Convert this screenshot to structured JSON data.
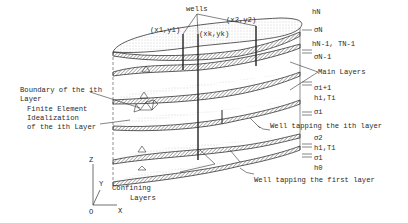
{
  "figure": {
    "labels": {
      "wells": "wells",
      "x1y1": "(x1,y1)",
      "xkyk": "(xk,yk)",
      "x2y2": "(x2,y2)",
      "hN": "hN",
      "sigmaN": "σN",
      "hN1TN1": "hN-1, TN-1",
      "sigmaN1": "σN-1",
      "main_layers": "Main Layers",
      "sigma_i1": "σi+1",
      "hiTi_upper": "hi,Ti",
      "sigma_i": "σi",
      "well_ith": "Well tapping the ith layer",
      "sigma2": "σ2",
      "h1T1": "h1,T1",
      "sigma1": "σ1",
      "h0": "h0",
      "well_first": "Well tapping the first layer",
      "boundary_line1": "Boundary of the ith",
      "boundary_line2": "Layer",
      "fe_line1": "Finite Element",
      "fe_line2": "Idealization",
      "fe_line3": "of the ith Layer",
      "confining_line1": "Confining",
      "confining_line2": "Layers",
      "axis_z": "Z",
      "axis_y": "Y",
      "axis_x": "X",
      "axis_o": "O"
    },
    "colors": {
      "ink": "#2a2a2a",
      "stipple": "#9a9a9a",
      "band": "#6a6a6a"
    }
  }
}
